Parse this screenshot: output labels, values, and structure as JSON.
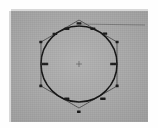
{
  "document": {
    "type": "scanned-technical-drawing",
    "subject": "circle-inscribed-in-hexagon",
    "page_background": "#fefefe",
    "panel_background": "#a9a9a9",
    "ink_color": "#141414"
  },
  "panel": {
    "x": 11,
    "y": 11,
    "width": 137,
    "height": 111
  },
  "figure": {
    "center": {
      "x": 68,
      "y": 53
    },
    "center_marker": "cross-tick",
    "circle": {
      "radius": 38,
      "stroke_width": 1.5,
      "label": "circle"
    },
    "polygon": {
      "sides": 6,
      "type": "circumscribed-hexagon",
      "stroke_width": 0.7,
      "label": "hexagon",
      "vertices": [
        {
          "id": "v-top",
          "x": 68,
          "y": 9
        },
        {
          "id": "v-upper-right",
          "x": 106,
          "y": 31
        },
        {
          "id": "v-lower-right",
          "x": 106,
          "y": 75
        },
        {
          "id": "v-bottom",
          "x": 68,
          "y": 97
        },
        {
          "id": "v-lower-left",
          "x": 30,
          "y": 75
        },
        {
          "id": "v-upper-left",
          "x": 30,
          "y": 31
        }
      ]
    },
    "leader_line": {
      "from_x": 68,
      "from_y": 13,
      "to_x": 134,
      "to_y": 14,
      "label": "top-leader"
    },
    "dimension_markers": [
      {
        "id": "d-top",
        "x": 68,
        "y": 13,
        "text": "R"
      },
      {
        "id": "d-upper-left-a",
        "x": 44,
        "y": 23,
        "text": "30"
      },
      {
        "id": "d-upper-left-b",
        "x": 56,
        "y": 18,
        "text": "30"
      },
      {
        "id": "d-upper-right-a",
        "x": 82,
        "y": 18,
        "text": "30"
      },
      {
        "id": "d-upper-right-b",
        "x": 94,
        "y": 23,
        "text": "30"
      },
      {
        "id": "d-left-vertex",
        "x": 30,
        "y": 31,
        "text": ""
      },
      {
        "id": "d-right-vertex",
        "x": 106,
        "y": 31,
        "text": ""
      },
      {
        "id": "d-left-mid",
        "x": 34,
        "y": 53,
        "text": "ø60"
      },
      {
        "id": "d-right-mid",
        "x": 102,
        "y": 53,
        "text": "ø60"
      },
      {
        "id": "d-left-lower",
        "x": 30,
        "y": 75,
        "text": ""
      },
      {
        "id": "d-right-lower",
        "x": 106,
        "y": 75,
        "text": ""
      },
      {
        "id": "d-lower-left-b",
        "x": 56,
        "y": 88,
        "text": "30"
      },
      {
        "id": "d-lower-right-b",
        "x": 92,
        "y": 88,
        "text": "30"
      },
      {
        "id": "d-bottom",
        "x": 68,
        "y": 101,
        "text": ""
      }
    ]
  }
}
